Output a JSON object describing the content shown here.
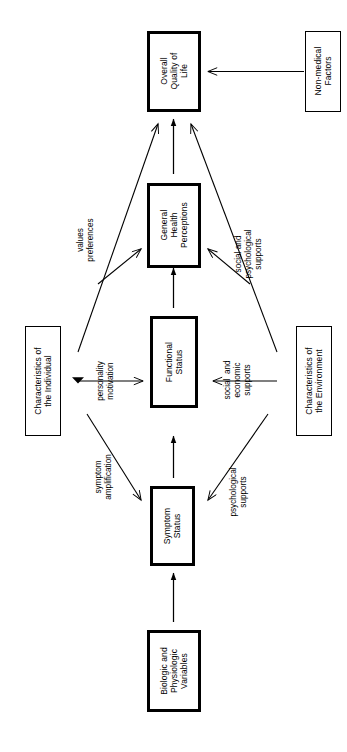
{
  "diagram": {
    "orientation": "rotated-90-ccw",
    "background_color": "#ffffff",
    "line_color": "#000000",
    "nodes": [
      {
        "id": "overall_qol",
        "label": "Overall\nQuality of\nLife",
        "border": "thick"
      },
      {
        "id": "nonmedical",
        "label": "Non-medical\nFactors",
        "border": "thin"
      },
      {
        "id": "general_health",
        "label": "General\nHealth\nPerceptions",
        "border": "thick"
      },
      {
        "id": "functional",
        "label": "Functional\nStatus",
        "border": "thick"
      },
      {
        "id": "symptom",
        "label": "Symptom\nStatus",
        "border": "thick"
      },
      {
        "id": "biologic",
        "label": "Biologic and\nPhysiologic\nVariables",
        "border": "thick"
      },
      {
        "id": "char_individual",
        "label": "Characteristics of\nthe Individual",
        "border": "thin"
      },
      {
        "id": "char_environment",
        "label": "Characteristics of\nthe Environment",
        "border": "thin"
      }
    ],
    "edge_labels": [
      {
        "id": "values_preferences",
        "text": "values\npreferences"
      },
      {
        "id": "social_psych_supports",
        "text": "social and\npsychological\nsupports"
      },
      {
        "id": "personality_motivation",
        "text": "personality\nmotivation"
      },
      {
        "id": "social_econ_supports",
        "text": "social  and\neconomic\nsupports"
      },
      {
        "id": "symptom_amplification",
        "text": "symptom\namplification"
      },
      {
        "id": "psych_supports",
        "text": "psychological\nsupports"
      }
    ],
    "edges": [
      {
        "from": "biologic",
        "to": "symptom",
        "style": "solid-arrow"
      },
      {
        "from": "symptom",
        "to": "functional",
        "style": "solid-arrow"
      },
      {
        "from": "functional",
        "to": "general_health",
        "style": "solid-arrow"
      },
      {
        "from": "general_health",
        "to": "overall_qol",
        "style": "solid-arrow"
      },
      {
        "from": "nonmedical",
        "to": "overall_qol",
        "style": "open-arrow"
      },
      {
        "from": "char_individual",
        "to": "overall_qol",
        "style": "open-arrow",
        "label": "values_preferences"
      },
      {
        "from": "char_individual",
        "to": "general_health",
        "style": "open-arrow",
        "label": "values_preferences"
      },
      {
        "from": "char_individual",
        "to": "functional",
        "style": "open-arrow",
        "label": "personality_motivation"
      },
      {
        "from": "char_individual",
        "to": "symptom",
        "style": "open-arrow",
        "label": "symptom_amplification"
      },
      {
        "from": "char_environment",
        "to": "overall_qol",
        "style": "open-arrow",
        "label": "social_psych_supports"
      },
      {
        "from": "char_environment",
        "to": "general_health",
        "style": "open-arrow",
        "label": "social_psych_supports"
      },
      {
        "from": "char_environment",
        "to": "functional",
        "style": "open-arrow",
        "label": "social_econ_supports"
      },
      {
        "from": "char_environment",
        "to": "symptom",
        "style": "open-arrow",
        "label": "psych_supports"
      }
    ]
  }
}
